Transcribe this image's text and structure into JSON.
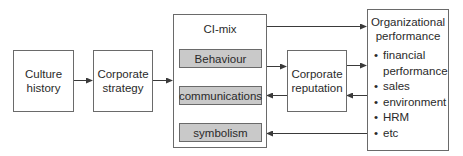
{
  "diagram": {
    "nodes": {
      "culture_history": "Culture history",
      "corporate_strategy": "Corporate strategy",
      "ci_mix": {
        "title": "CI-mix",
        "items": [
          "Behaviour",
          "communications",
          "symbolism"
        ]
      },
      "corporate_reputation": "Corporate reputation",
      "organizational_performance": {
        "title": "Organizational performance",
        "items": [
          "financial performance",
          "sales",
          "environment",
          "HRM",
          "etc"
        ]
      }
    },
    "edges": [
      {
        "from": "Culture history",
        "to": "Corporate strategy"
      },
      {
        "from": "Corporate strategy",
        "to": "CI-mix"
      },
      {
        "from": "CI-mix",
        "to": "Organizational performance"
      },
      {
        "from": "Behaviour",
        "to": "Corporate reputation"
      },
      {
        "from": "Corporate reputation",
        "to": "Organizational performance"
      },
      {
        "from": "Organizational performance",
        "to": "Corporate reputation"
      },
      {
        "from": "Corporate reputation",
        "to": "communications"
      },
      {
        "from": "Organizational performance",
        "to": "symbolism"
      }
    ],
    "colors": {
      "line": "#3a3a3a",
      "inner_fill": "#c9c9c9",
      "border": "#6a6a6a"
    }
  }
}
